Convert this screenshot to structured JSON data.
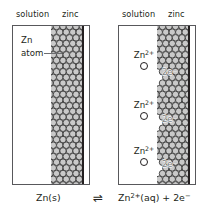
{
  "figure": {
    "title_semantic": "zinc-metal-solution-equilibrium-diagram",
    "panels": [
      {
        "id": "left",
        "header_solution": "solution",
        "header_zinc": "zinc",
        "label_line1": "Zn",
        "label_line2": "atom",
        "ions": [],
        "electrons": []
      },
      {
        "id": "right",
        "header_solution": "solution",
        "header_zinc": "zinc",
        "ions": [
          {
            "label": "Zn",
            "charge": "2+"
          },
          {
            "label": "Zn",
            "charge": "2+"
          },
          {
            "label": "Zn",
            "charge": "2+"
          }
        ],
        "electrons": [
          {
            "count": "2e",
            "charge": "−"
          },
          {
            "count": "2e",
            "charge": "−"
          },
          {
            "count": "2e",
            "charge": "−"
          }
        ]
      }
    ],
    "equation": {
      "left": "Zn(s)",
      "arrow": "⇌",
      "right_species": "Zn",
      "right_charge": "2+",
      "right_state": "(aq)",
      "right_plus": " + 2e",
      "right_electron_charge": "−"
    },
    "colors": {
      "ink": "#231f20",
      "box_border": "#58585b",
      "lattice_fill": "#c9c9c9",
      "lattice_stroke": "#3a3a3a",
      "electron_text": "#808285",
      "leader_line": "#6d6e71"
    }
  }
}
